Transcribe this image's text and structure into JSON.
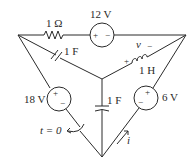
{
  "diagram": {
    "type": "circuit",
    "nodes": {
      "left": [
        18,
        35
      ],
      "right": [
        186,
        35
      ],
      "center": [
        102,
        79
      ],
      "bottom": [
        102,
        157
      ]
    },
    "components": {
      "resistor_top": {
        "label": "1 Ω",
        "between": [
          "left",
          "12V-source"
        ]
      },
      "source_top": {
        "label": "12 V",
        "plus": "+",
        "minus": "−"
      },
      "capacitor_diag": {
        "label": "1 F",
        "between": [
          "left",
          "center"
        ]
      },
      "inductor": {
        "label": "1 H",
        "voltage_label": "v",
        "plus": "+",
        "minus": "−",
        "between": [
          "center",
          "right"
        ]
      },
      "source_left": {
        "label": "18 V",
        "plus": "+",
        "minus": "−"
      },
      "capacitor_vertical": {
        "label": "1 F",
        "between": [
          "center",
          "bottom"
        ]
      },
      "source_right": {
        "label": "6 V",
        "plus": "+",
        "minus": "−"
      },
      "switch": {
        "label": "t = 0"
      },
      "current": {
        "label": "i"
      }
    }
  }
}
